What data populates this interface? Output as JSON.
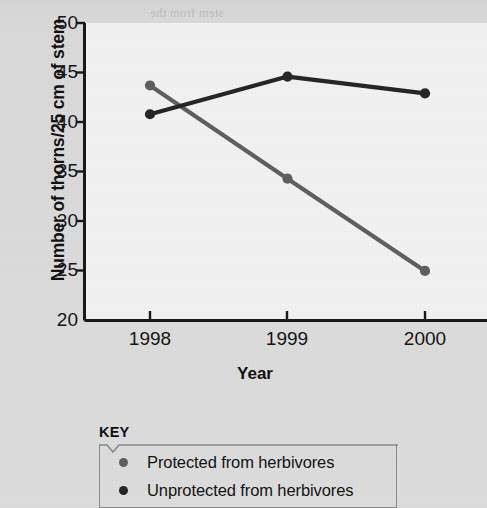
{
  "chart_data": {
    "type": "line",
    "title": "",
    "xlabel": "Year",
    "ylabel": "Number of thorns/25 cm of stem",
    "categories": [
      "1998",
      "1999",
      "2000"
    ],
    "x": [
      1998,
      1999,
      2000
    ],
    "xlim": [
      1997.6,
      2000.4
    ],
    "ylim": [
      20,
      50
    ],
    "yticks": [
      20,
      25,
      30,
      35,
      40,
      45,
      50
    ],
    "xticks": [
      "1998",
      "1999",
      "2000"
    ],
    "grid": false,
    "legend_position": "below-plot",
    "legend_title": "KEY",
    "series": [
      {
        "name": "Protected from herbivores",
        "color": "#5f5f5f",
        "marker": "circle",
        "values": [
          43.7,
          34.3,
          25.0
        ]
      },
      {
        "name": "Unprotected from herbivores",
        "color": "#262626",
        "marker": "circle",
        "values": [
          40.8,
          44.6,
          42.9
        ]
      }
    ]
  },
  "axes": {
    "ytick_labels": [
      "50",
      "45",
      "40",
      "35",
      "30",
      "25",
      "20"
    ],
    "xtick_labels": [
      "1998",
      "1999",
      "2000"
    ],
    "y_axis_title": "Number of thorns/25 cm of stem",
    "x_axis_title": "Year"
  },
  "key": {
    "title": "KEY",
    "entries": [
      {
        "label": "Protected from herbivores",
        "color": "#5f5f5f"
      },
      {
        "label": "Unprotected from herbivores",
        "color": "#262626"
      }
    ]
  },
  "colors": {
    "page_background": "#d8d8d8",
    "plot_background": "#f1f1f1",
    "axis": "#1a1a1a",
    "series_protected": "#5f5f5f",
    "series_unprotected": "#262626",
    "key_border": "#8a8a8a"
  },
  "ghost_text": [
    "stem from the",
    "to the plant; these",
    "are found on the",
    "a those who are",
    "for herbivores at",
    "is mutualistic"
  ]
}
